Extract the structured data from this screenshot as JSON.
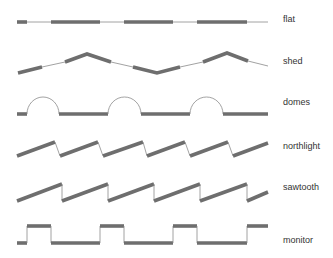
{
  "diagram": {
    "title": "",
    "rows": [
      {
        "id": "flat",
        "label": "flat"
      },
      {
        "id": "shed",
        "label": "shed"
      },
      {
        "id": "domes",
        "label": "domes"
      },
      {
        "id": "northlight",
        "label": "northlight"
      },
      {
        "id": "sawtooth",
        "label": "sawtooth"
      },
      {
        "id": "monitor",
        "label": "monitor"
      }
    ]
  },
  "colors": {
    "roof_surface": "#6e6e6e",
    "glazing_line": "#8a8a8a",
    "label_text": "#333333",
    "background": "#ffffff"
  }
}
